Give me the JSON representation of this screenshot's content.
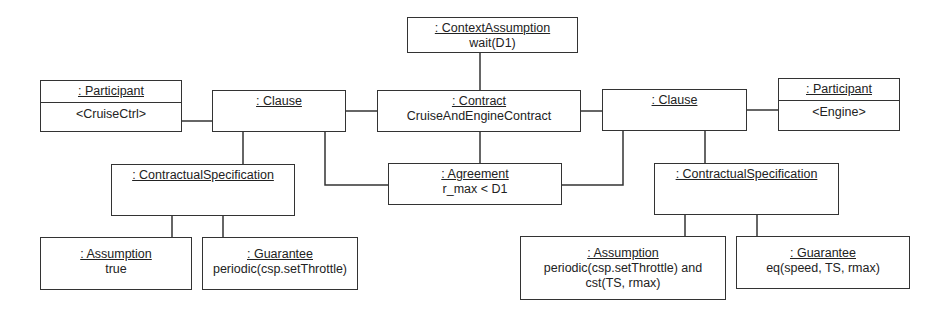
{
  "diagram": {
    "type": "UML object diagram",
    "nodes": {
      "context_assumption": {
        "title": ": ContextAssumption",
        "value": "wait(D1)"
      },
      "participant_left": {
        "title": ": Participant",
        "value": "<CruiseCtrl>"
      },
      "clause_left": {
        "title": ": Clause",
        "value": ""
      },
      "contract": {
        "title": ": Contract",
        "value": "CruiseAndEngineContract"
      },
      "clause_right": {
        "title": ": Clause",
        "value": ""
      },
      "participant_right": {
        "title": ": Participant",
        "value": "<Engine>"
      },
      "agreement": {
        "title": ": Agreement",
        "value": "r_max < D1"
      },
      "spec_left": {
        "title": ": ContractualSpecification",
        "value": ""
      },
      "spec_right": {
        "title": ": ContractualSpecification",
        "value": ""
      },
      "assumption_left": {
        "title": ": Assumption",
        "value": "true"
      },
      "guarantee_left": {
        "title": ": Guarantee",
        "value": "periodic(csp.setThrottle)"
      },
      "assumption_right": {
        "title": ": Assumption",
        "value_line1": "periodic(csp.setThrottle) and",
        "value_line2": "cst(TS, rmax)"
      },
      "guarantee_right": {
        "title": ": Guarantee",
        "value": "eq(speed, TS, rmax)"
      }
    },
    "edges": [
      [
        "context_assumption",
        "contract"
      ],
      [
        "participant_left",
        "clause_left"
      ],
      [
        "clause_left",
        "contract"
      ],
      [
        "contract",
        "clause_right"
      ],
      [
        "clause_right",
        "participant_right"
      ],
      [
        "contract",
        "agreement"
      ],
      [
        "clause_left",
        "agreement"
      ],
      [
        "clause_right",
        "agreement"
      ],
      [
        "clause_left",
        "spec_left"
      ],
      [
        "clause_right",
        "spec_right"
      ],
      [
        "spec_left",
        "assumption_left"
      ],
      [
        "spec_left",
        "guarantee_left"
      ],
      [
        "spec_right",
        "assumption_right"
      ],
      [
        "spec_right",
        "guarantee_right"
      ]
    ]
  }
}
